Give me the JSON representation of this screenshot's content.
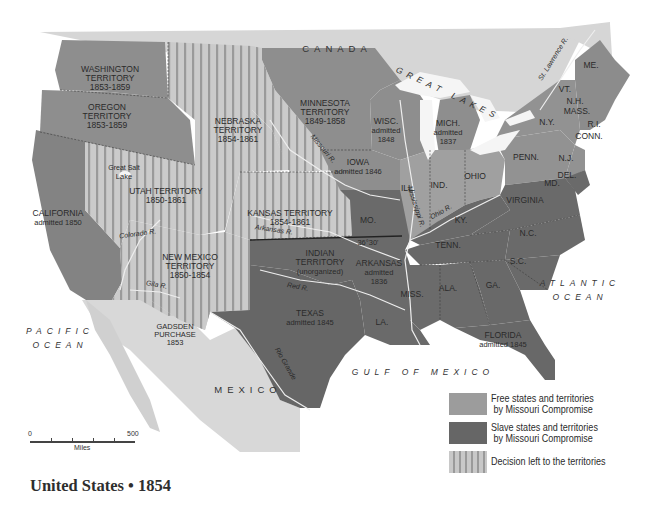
{
  "title": "United States • 1854",
  "colors": {
    "free": "#9c9c9c",
    "slave": "#666666",
    "decision_light": "#c8c8c8",
    "decision_stripe": "#9a9a9a",
    "foreign_land": "#d4d4d4",
    "water": "#ffffff",
    "lakes": "#f4f4f4"
  },
  "countries": {
    "canada": "CANADA",
    "mexico": "MEXICO"
  },
  "water_bodies": {
    "great_lakes": "GREAT LAKES",
    "pacific_1": "PACIFIC",
    "pacific_2": "OCEAN",
    "atlantic_1": "ATLANTIC",
    "atlantic_2": "OCEAN",
    "gulf": "GULF OF MEXICO",
    "great_salt_lake_1": "Great Salt",
    "great_salt_lake_2": "Lake"
  },
  "regions": {
    "washington": {
      "name": "WASHINGTON",
      "line2": "TERRITORY",
      "line3": "1853-1859",
      "status": "free"
    },
    "oregon": {
      "name": "OREGON",
      "line2": "TERRITORY",
      "line3": "1853-1859",
      "status": "free"
    },
    "nebraska": {
      "name": "NEBRASKA",
      "line2": "TERRITORY",
      "line3": "1854-1861",
      "status": "decision"
    },
    "minnesota": {
      "name": "MINNESOTA",
      "line2": "TERRITORY",
      "line3": "1849-1858",
      "status": "free"
    },
    "wisconsin": {
      "name": "WISC.",
      "line2": "admitted",
      "line3": "1848",
      "status": "free"
    },
    "michigan": {
      "name": "MICH.",
      "line2": "admitted",
      "line3": "1837",
      "status": "free"
    },
    "iowa": {
      "name": "IOWA",
      "line2": "admitted 1846",
      "status": "free"
    },
    "utah": {
      "name": "UTAH TERRITORY",
      "line2": "1850-1861",
      "status": "decision"
    },
    "california": {
      "name": "CALIFORNIA",
      "line2": "admitted 1850",
      "status": "free"
    },
    "kansas": {
      "name": "KANSAS TERRITORY",
      "line2": "1854-1861",
      "status": "decision"
    },
    "new_mexico": {
      "name": "NEW MEXICO",
      "line2": "TERRITORY",
      "line3": "1850-1854",
      "status": "decision"
    },
    "indian": {
      "name": "INDIAN",
      "line2": "TERRITORY",
      "line3": "(unorganized)",
      "status": "slave"
    },
    "arkansas": {
      "name": "ARKANSAS",
      "line2": "admitted",
      "line3": "1836",
      "status": "slave"
    },
    "texas": {
      "name": "TEXAS",
      "line2": "admitted 1845",
      "status": "slave"
    },
    "gadsden": {
      "name": "GADSDEN",
      "line2": "PURCHASE",
      "line3": "1853",
      "status": "decision"
    },
    "florida": {
      "name": "FLORIDA",
      "line2": "admitted 1845",
      "status": "slave"
    },
    "illinois": {
      "name": "ILL.",
      "status": "free"
    },
    "indiana": {
      "name": "IND.",
      "status": "free"
    },
    "ohio": {
      "name": "OHIO",
      "status": "free"
    },
    "missouri": {
      "name": "MO.",
      "status": "slave"
    },
    "kentucky": {
      "name": "KY.",
      "status": "slave"
    },
    "tennessee": {
      "name": "TENN.",
      "status": "slave"
    },
    "virginia": {
      "name": "VIRGINIA",
      "status": "slave"
    },
    "north_carolina": {
      "name": "N.C.",
      "status": "slave"
    },
    "south_carolina": {
      "name": "S.C.",
      "status": "slave"
    },
    "georgia": {
      "name": "GA.",
      "status": "slave"
    },
    "alabama": {
      "name": "ALA.",
      "status": "slave"
    },
    "mississippi": {
      "name": "MISS.",
      "status": "slave"
    },
    "louisiana": {
      "name": "LA.",
      "status": "slave"
    },
    "pennsylvania": {
      "name": "PENN.",
      "status": "free"
    },
    "new_york": {
      "name": "N.Y.",
      "status": "free"
    },
    "new_jersey": {
      "name": "N.J.",
      "status": "free"
    },
    "delaware": {
      "name": "DEL.",
      "status": "slave"
    },
    "maryland": {
      "name": "MD.",
      "status": "slave"
    },
    "vermont": {
      "name": "VT.",
      "status": "free"
    },
    "new_hampshire": {
      "name": "N.H.",
      "status": "free"
    },
    "massachusetts": {
      "name": "MASS.",
      "status": "free"
    },
    "rhode_island": {
      "name": "R.I.",
      "status": "free"
    },
    "connecticut": {
      "name": "CONN.",
      "status": "free"
    },
    "maine": {
      "name": "ME.",
      "status": "free"
    }
  },
  "rivers": {
    "missouri": "Missouri R.",
    "mississippi": "Mississippi R.",
    "ohio": "Ohio R.",
    "arkansas": "Arkansas R.",
    "red": "Red R.",
    "colorado": "Colorado R.",
    "gila": "Gila R.",
    "rio_grande": "Rio Grande",
    "st_lawrence": "St. Lawrence R."
  },
  "annotations": {
    "parallel": "36°30'"
  },
  "scale": {
    "start": "0",
    "end": "500",
    "unit": "Miles"
  },
  "legend": [
    {
      "line1": "Free states and territories",
      "line2": " by Missouri Compromise",
      "key": "free"
    },
    {
      "line1": "Slave states and territories",
      "line2": " by Missouri Compromise",
      "key": "slave"
    },
    {
      "line1": "Decision left to the territories",
      "line2": "",
      "key": "decision"
    }
  ]
}
